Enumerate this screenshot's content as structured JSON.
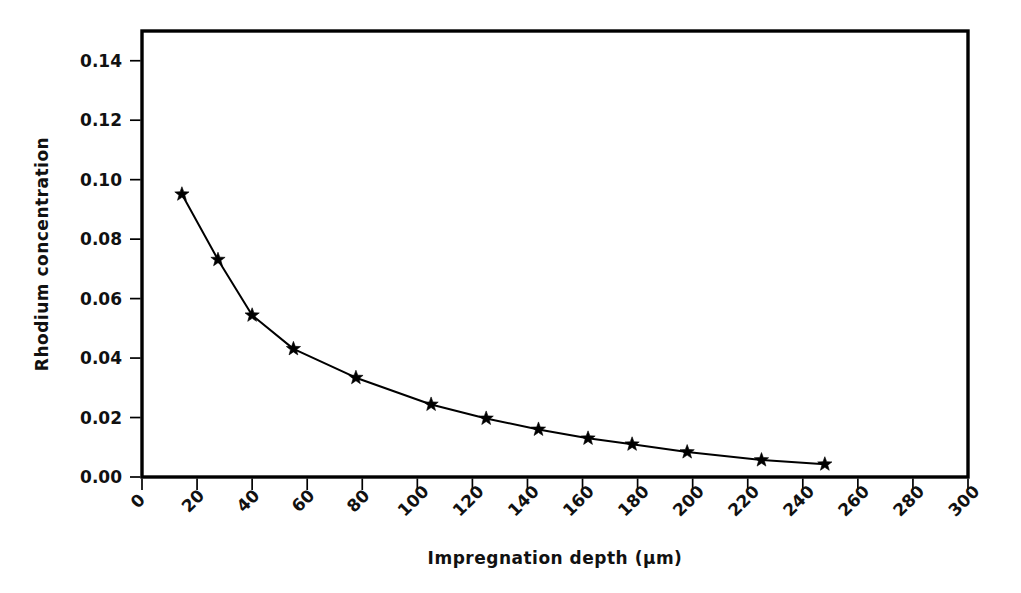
{
  "chart_data": {
    "type": "line",
    "title": "",
    "xlabel": "Impregnation depth (µm)",
    "ylabel": "Rhodium  concentration",
    "xlim": [
      0,
      300
    ],
    "ylim": [
      0.0,
      0.15
    ],
    "grid": false,
    "legend": "none",
    "marker": "star",
    "line_color": "#000000",
    "x": [
      14.5,
      27.6,
      40.0,
      55.0,
      77.7,
      105.0,
      125.0,
      144.0,
      162.0,
      178.0,
      198.0,
      225.0,
      248.0
    ],
    "y": [
      0.0951,
      0.0731,
      0.0544,
      0.0431,
      0.0334,
      0.0244,
      0.0197,
      0.016,
      0.013,
      0.011,
      0.0084,
      0.0057,
      0.0043
    ],
    "series": [
      {
        "name": "Rhodium concentration",
        "points": [
          {
            "x": 14.5,
            "y": 0.0951
          },
          {
            "x": 27.6,
            "y": 0.0731
          },
          {
            "x": 40.0,
            "y": 0.0544
          },
          {
            "x": 55.0,
            "y": 0.0431
          },
          {
            "x": 77.7,
            "y": 0.0334
          },
          {
            "x": 105.0,
            "y": 0.0244
          },
          {
            "x": 125.0,
            "y": 0.0197
          },
          {
            "x": 144.0,
            "y": 0.016
          },
          {
            "x": 162.0,
            "y": 0.013
          },
          {
            "x": 178.0,
            "y": 0.011
          },
          {
            "x": 198.0,
            "y": 0.0084
          },
          {
            "x": 225.0,
            "y": 0.0057
          },
          {
            "x": 248.0,
            "y": 0.0043
          }
        ]
      }
    ],
    "xticks": [
      0,
      20,
      40,
      60,
      80,
      100,
      120,
      140,
      160,
      180,
      200,
      220,
      240,
      260,
      280,
      300
    ],
    "xtick_labels": [
      "0",
      "20",
      "40",
      "60",
      "80",
      "100",
      "120",
      "140",
      "160",
      "180",
      "200",
      "220",
      "240",
      "260",
      "280",
      "300"
    ],
    "xtick_label_rotation": -45,
    "yticks": [
      0.0,
      0.02,
      0.04,
      0.06,
      0.08,
      0.1,
      0.12,
      0.14
    ],
    "ytick_labels": [
      "0.00",
      "0.02",
      "0.04",
      "0.06",
      "0.08",
      "0.10",
      "0.12",
      "0.14"
    ]
  }
}
